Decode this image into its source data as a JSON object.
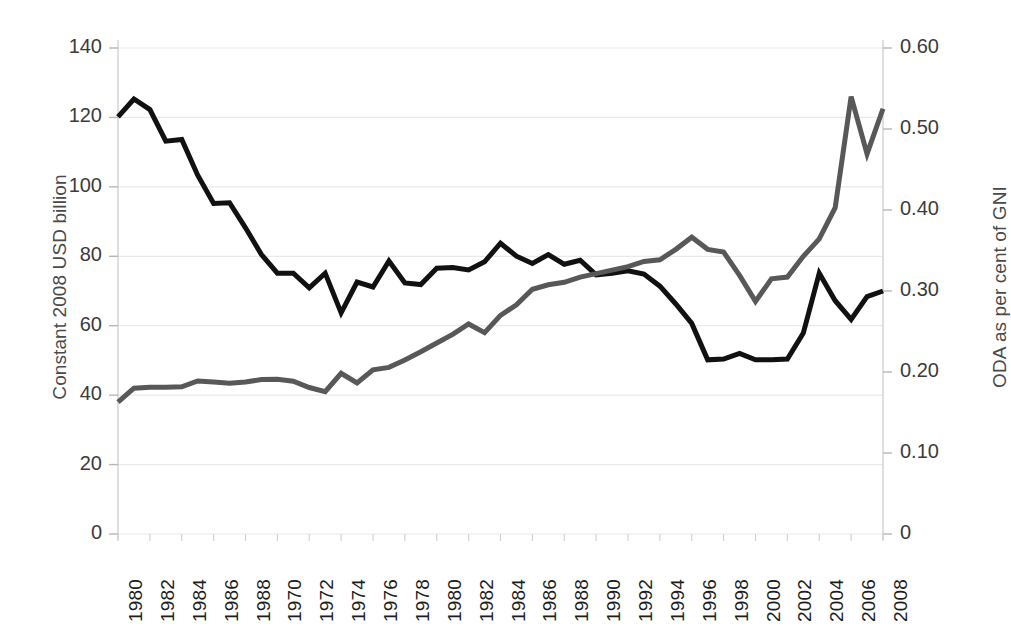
{
  "chart_data": {
    "type": "line",
    "title": "",
    "subtitle": "",
    "xlabel": "",
    "ylabel": "Constant 2008 USD billion",
    "ylabel_right": "ODA as per cent of GNI",
    "grid": true,
    "legend_position": "none",
    "x_tick_labels": [
      "1980",
      "1982",
      "1984",
      "1986",
      "1988",
      "1970",
      "1972",
      "1974",
      "1976",
      "1978",
      "1980",
      "1982",
      "1984",
      "1986",
      "1988",
      "1990",
      "1992",
      "1994",
      "1996",
      "1998",
      "2000",
      "2002",
      "2004",
      "2006",
      "2008"
    ],
    "y_tick_labels_left": [
      "0",
      "20",
      "40",
      "60",
      "80",
      "100",
      "120",
      "140"
    ],
    "y_tick_labels_right": [
      "0",
      "0.10",
      "0.20",
      "0.30",
      "0.40",
      "0.50",
      "0.60"
    ],
    "ylim_left": [
      0,
      140
    ],
    "ylim_right": [
      0,
      0.6
    ],
    "x_index_count": 49,
    "series": [
      {
        "name": "ODA as per cent of GNI",
        "axis": "right",
        "color": "#111111",
        "line_width": 5,
        "values": [
          0.515,
          0.537,
          0.524,
          0.485,
          0.487,
          0.443,
          0.408,
          0.409,
          0.378,
          0.345,
          0.322,
          0.322,
          0.304,
          0.322,
          0.273,
          0.311,
          0.305,
          0.337,
          0.31,
          0.308,
          0.328,
          0.329,
          0.326,
          0.336,
          0.359,
          0.343,
          0.334,
          0.345,
          0.333,
          0.338,
          0.32,
          0.322,
          0.325,
          0.321,
          0.306,
          0.284,
          0.26,
          0.215,
          0.216,
          0.223,
          0.215,
          0.215,
          0.216,
          0.248,
          0.322,
          0.288,
          0.265,
          0.293,
          0.3
        ]
      },
      {
        "name": "Constant 2008 USD billion",
        "axis": "left",
        "color": "#585858",
        "line_width": 5,
        "values": [
          38.0,
          42.0,
          42.3,
          42.3,
          42.4,
          44.1,
          43.8,
          43.4,
          43.8,
          44.5,
          44.6,
          44.0,
          42.2,
          41.0,
          46.3,
          43.5,
          47.3,
          48.0,
          50.1,
          52.5,
          55.0,
          57.5,
          60.5,
          58.0,
          63.0,
          66.0,
          70.5,
          71.8,
          72.5,
          74.0,
          75.0,
          76.0,
          77.0,
          78.5,
          79.0,
          82.0,
          85.5,
          82.0,
          81.2,
          74.5,
          67.0,
          73.5,
          74.0,
          80.0,
          85.0,
          94.0,
          126.0,
          109.5,
          122.5
        ]
      }
    ]
  },
  "axis_titles": {
    "left": "Constant 2008 USD billion",
    "right": "ODA as per cent of GNI"
  },
  "colors": {
    "black_series": "#111111",
    "gray_series": "#585858",
    "gridline": "#e9e9e9",
    "axis_line": "#d2d2d2",
    "tick_text": "#3b3b3b",
    "axis_title_text": "#4a4a4a",
    "background": "#ffffff"
  }
}
